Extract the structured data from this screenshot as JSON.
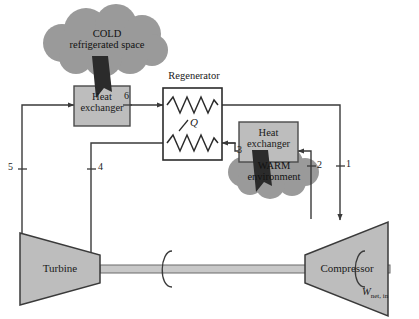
{
  "figure": {
    "type": "process-flow-diagram",
    "width": 419,
    "height": 319,
    "background_color": "#ffffff"
  },
  "clouds": [
    {
      "id": "cold-space",
      "line1": "COLD",
      "line2": "refrigerated space",
      "fill_color": "#9a9a9a",
      "arrow_direction": "down-right",
      "arrow_target": "heat-exchanger-cold"
    },
    {
      "id": "warm-environment",
      "line1": "WARM",
      "line2": "environment",
      "fill_color": "#9a9a9a",
      "arrow_direction": "down-right",
      "arrow_source": "heat-exchanger-warm"
    }
  ],
  "components": {
    "heat_exchanger_cold": {
      "line1": "Heat",
      "line2": "exchanger",
      "fill_color": "#bdbdbd"
    },
    "heat_exchanger_warm": {
      "line1": "Heat",
      "line2": "exchanger",
      "fill_color": "#bdbdbd"
    },
    "regenerator": {
      "title": "Regenerator",
      "heat_symbol": "Q",
      "fill_color": "#ffffff"
    },
    "turbine": {
      "label": "Turbine",
      "fill_color": "#bdbdbd"
    },
    "compressor": {
      "label": "Compressor",
      "fill_color": "#bdbdbd"
    },
    "shaft": {
      "fill_color": "#c8c8c8"
    }
  },
  "work": {
    "symbol": "W",
    "subscript": "net, in"
  },
  "state_points": [
    {
      "id": "1",
      "label": "1"
    },
    {
      "id": "2",
      "label": "2"
    },
    {
      "id": "3",
      "label": "3"
    },
    {
      "id": "4",
      "label": "4"
    },
    {
      "id": "5",
      "label": "5"
    },
    {
      "id": "6",
      "label": "6"
    }
  ],
  "colors": {
    "line": "#3a3a3a",
    "box_fill": "#bdbdbd",
    "cloud_fill": "#9a9a9a",
    "shaft_fill": "#c8c8c8",
    "text": "#1a1a1a"
  }
}
